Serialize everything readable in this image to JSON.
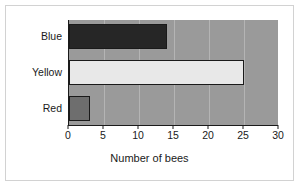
{
  "chart_data": {
    "type": "bar",
    "orientation": "horizontal",
    "title": "",
    "xlabel": "Number of bees",
    "ylabel": "",
    "categories": [
      "Blue",
      "Yellow",
      "Red"
    ],
    "values": [
      14,
      25,
      3
    ],
    "bar_colors": [
      "#262626",
      "#e8e8e8",
      "#6e6e6e"
    ],
    "bar_border_color": "#1a1a1a",
    "xlim": [
      0,
      30
    ],
    "xticks": [
      0,
      5,
      10,
      15,
      20,
      25,
      30
    ],
    "xtick_labels": [
      "0",
      "5",
      "10",
      "15",
      "20",
      "25",
      "30"
    ],
    "grid": true,
    "gridline_axis": "x",
    "legend": false,
    "plot_background": "#9a9a9a",
    "figure_background": "#ffffff",
    "border_color": "#d2d2d2"
  }
}
